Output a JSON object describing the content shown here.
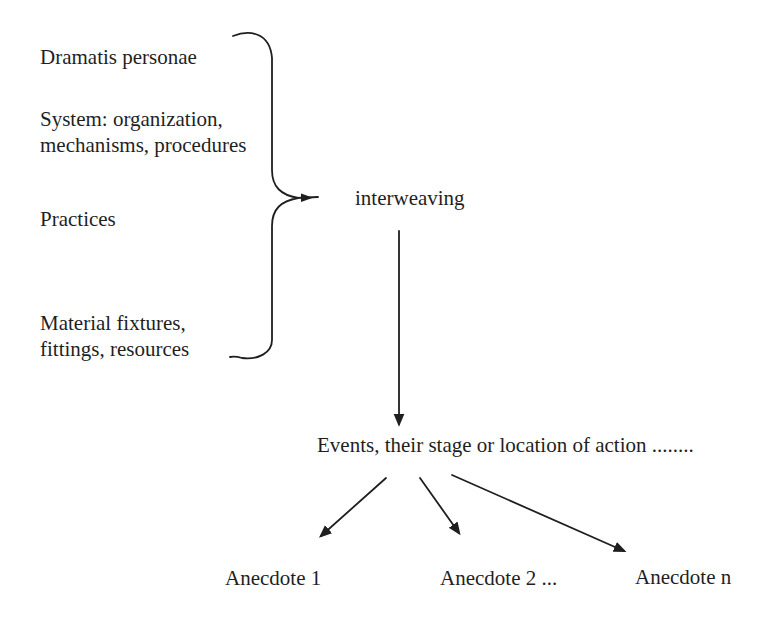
{
  "diagram": {
    "components": [
      {
        "label": "Dramatis personae"
      },
      {
        "label": "System: organization,\nmechanisms, procedures"
      },
      {
        "label": "Practices"
      },
      {
        "label": "Material fixtures,\nfittings, resources"
      }
    ],
    "process": {
      "label": "interweaving"
    },
    "events": {
      "label": "Events, their stage or location of action  ........"
    },
    "anecdotes": [
      {
        "label": "Anecdote 1"
      },
      {
        "label": "Anecdote 2 ..."
      },
      {
        "label": "Anecdote n"
      }
    ],
    "colors": {
      "ink": "#1f1f1f",
      "background": "#ffffff"
    }
  }
}
